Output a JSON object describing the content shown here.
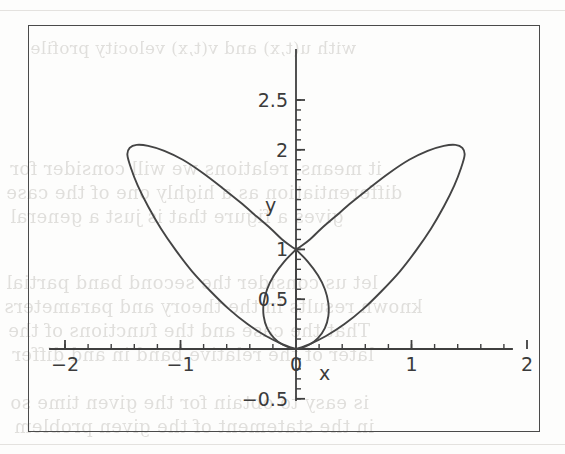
{
  "figure": {
    "kind": "scanned-textbook-figure",
    "frame_border_color": "#4a4a4a",
    "curve_color": "#444444",
    "background_color": "#fdfdfc"
  },
  "axes": {
    "x_axis_label": "x",
    "y_axis_label": "y",
    "x_ticks": [
      {
        "value": -2,
        "label": "-2"
      },
      {
        "value": -1,
        "label": "-1"
      },
      {
        "value": 0,
        "label": "0"
      },
      {
        "value": 1,
        "label": "1"
      },
      {
        "value": 2,
        "label": "2"
      }
    ],
    "y_ticks": [
      {
        "value": 2.5,
        "label": "2.5"
      },
      {
        "value": 2,
        "label": "2"
      },
      {
        "value": 1,
        "label": "1"
      },
      {
        "value": 0.5,
        "label": "0.5"
      },
      {
        "value": -0.5,
        "label": "-0.5"
      }
    ],
    "x_minor_tick_step": 0.2,
    "y_minor_tick_step": 0.1
  },
  "chart_data": {
    "type": "line",
    "title": "",
    "subtitle": "",
    "xlabel": "x",
    "ylabel": "y",
    "xlim": [
      -2,
      2
    ],
    "ylim": [
      -0.5,
      2.5
    ],
    "grid": false,
    "legend": null,
    "annotations": [],
    "x_tick_values": [
      -2,
      -1,
      0,
      1,
      2
    ],
    "x_tick_labels": [
      "-2",
      "-1",
      "0",
      "1",
      "2"
    ],
    "y_tick_values": [
      2.5,
      2,
      1,
      0.5,
      -0.5
    ],
    "y_tick_labels": [
      "2.5",
      "2",
      "1",
      "0.5",
      "-0.5"
    ],
    "series": [
      {
        "name": "right-lobe",
        "points": [
          [
            0.0,
            0.0
          ],
          [
            0.12,
            0.05
          ],
          [
            0.26,
            0.13
          ],
          [
            0.42,
            0.25
          ],
          [
            0.58,
            0.4
          ],
          [
            0.74,
            0.58
          ],
          [
            0.9,
            0.78
          ],
          [
            1.04,
            0.99
          ],
          [
            1.17,
            1.21
          ],
          [
            1.28,
            1.43
          ],
          [
            1.37,
            1.64
          ],
          [
            1.43,
            1.82
          ],
          [
            1.46,
            1.95
          ],
          [
            1.44,
            2.02
          ],
          [
            1.38,
            2.05
          ],
          [
            1.28,
            2.04
          ],
          [
            1.14,
            1.99
          ],
          [
            0.98,
            1.9
          ],
          [
            0.81,
            1.77
          ],
          [
            0.64,
            1.62
          ],
          [
            0.48,
            1.47
          ],
          [
            0.34,
            1.33
          ],
          [
            0.22,
            1.21
          ],
          [
            0.12,
            1.1
          ],
          [
            0.04,
            1.03
          ],
          [
            0.0,
            1.0
          ]
        ]
      },
      {
        "name": "left-lobe",
        "points": [
          [
            0.0,
            0.0
          ],
          [
            -0.12,
            0.05
          ],
          [
            -0.26,
            0.13
          ],
          [
            -0.42,
            0.25
          ],
          [
            -0.58,
            0.4
          ],
          [
            -0.74,
            0.58
          ],
          [
            -0.9,
            0.78
          ],
          [
            -1.04,
            0.99
          ],
          [
            -1.17,
            1.21
          ],
          [
            -1.28,
            1.43
          ],
          [
            -1.37,
            1.64
          ],
          [
            -1.43,
            1.82
          ],
          [
            -1.46,
            1.95
          ],
          [
            -1.44,
            2.02
          ],
          [
            -1.38,
            2.05
          ],
          [
            -1.28,
            2.04
          ],
          [
            -1.14,
            1.99
          ],
          [
            -0.98,
            1.9
          ],
          [
            -0.81,
            1.77
          ],
          [
            -0.64,
            1.62
          ],
          [
            -0.48,
            1.47
          ],
          [
            -0.34,
            1.33
          ],
          [
            -0.22,
            1.21
          ],
          [
            -0.12,
            1.1
          ],
          [
            -0.04,
            1.03
          ],
          [
            0.0,
            1.0
          ]
        ]
      },
      {
        "name": "center-lobe",
        "points": [
          [
            0.0,
            1.0
          ],
          [
            -0.1,
            0.88
          ],
          [
            -0.19,
            0.74
          ],
          [
            -0.25,
            0.6
          ],
          [
            -0.28,
            0.46
          ],
          [
            -0.28,
            0.33
          ],
          [
            -0.25,
            0.21
          ],
          [
            -0.19,
            0.11
          ],
          [
            -0.11,
            0.04
          ],
          [
            0.0,
            0.0
          ],
          [
            0.11,
            0.04
          ],
          [
            0.19,
            0.11
          ],
          [
            0.25,
            0.21
          ],
          [
            0.28,
            0.33
          ],
          [
            0.28,
            0.46
          ],
          [
            0.25,
            0.6
          ],
          [
            0.19,
            0.74
          ],
          [
            0.1,
            0.88
          ],
          [
            0.0,
            1.0
          ]
        ]
      }
    ]
  },
  "background_text": {
    "lines": [
      {
        "text": "with  u(t,x)  and  v(t,x)  velocity profile",
        "x": 30,
        "y": 38,
        "size": 17
      },
      {
        "text": "it means. relations  we will consider  for",
        "x": 10,
        "y": 158,
        "size": 18
      },
      {
        "text": "differentiation as a highly  one  of  the  case",
        "x": 6,
        "y": 182,
        "size": 18
      },
      {
        "text": "gives  a  figure  that  is  just  a  general",
        "x": 10,
        "y": 206,
        "size": 18
      },
      {
        "text": "let us  consider  the  second  band  partial",
        "x": 6,
        "y": 272,
        "size": 18
      },
      {
        "text": "known  results  in  the  theory  and  parameters",
        "x": 4,
        "y": 296,
        "size": 18
      },
      {
        "text": "That  the  case  and  the  functions  of  the",
        "x": 8,
        "y": 320,
        "size": 18
      },
      {
        "text": "later  of  the  relative  band  in  and  differ",
        "x": 12,
        "y": 344,
        "size": 18
      },
      {
        "text": "is  easy  to  obtain  for  the  given  time  so",
        "x": 10,
        "y": 392,
        "size": 18
      },
      {
        "text": "in  the  statement  of  the  given  problem",
        "x": 14,
        "y": 416,
        "size": 18
      }
    ]
  }
}
